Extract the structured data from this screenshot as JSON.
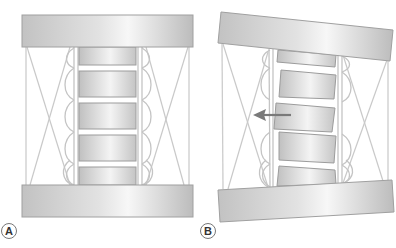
{
  "figure": {
    "panels": [
      {
        "label": "A",
        "state": "neutral alignment",
        "description": "Stack of five vertebra-like blocks between two horizontal plates, with crossed tension cables and curved ligament loops on each side"
      },
      {
        "label": "B",
        "state": "tilted plates with lateral shift",
        "description": "Plates tilted; middle block displaced leftward indicated by arrow"
      }
    ],
    "arrow": {
      "direction": "left",
      "color": "#7a7a7a"
    },
    "colors": {
      "plate_fill_light": "#f2f2f2",
      "plate_fill_dark": "#bdbdbd",
      "plate_stroke": "#9a9a9a",
      "cable": "#c9c9c9",
      "ligament": "#c4c4c4",
      "label_circle": "#666666"
    }
  }
}
